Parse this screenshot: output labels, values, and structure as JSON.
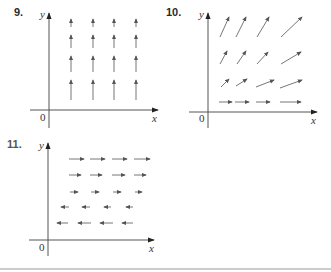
{
  "problems": [
    {
      "number": "9.",
      "axis_x_label": "x",
      "axis_y_label": "y",
      "origin_label": "0",
      "description": "Vector field: all vectors point straight up; length increases as y decreases",
      "vectors": [
        {
          "x1": 71,
          "y1": 27,
          "x2": 71,
          "y2": 19
        },
        {
          "x1": 93,
          "y1": 27,
          "x2": 93,
          "y2": 19
        },
        {
          "x1": 114,
          "y1": 27,
          "x2": 114,
          "y2": 19
        },
        {
          "x1": 136,
          "y1": 27,
          "x2": 136,
          "y2": 19
        },
        {
          "x1": 71,
          "y1": 48,
          "x2": 71,
          "y2": 35
        },
        {
          "x1": 93,
          "y1": 48,
          "x2": 93,
          "y2": 35
        },
        {
          "x1": 114,
          "y1": 48,
          "x2": 114,
          "y2": 35
        },
        {
          "x1": 136,
          "y1": 48,
          "x2": 136,
          "y2": 35
        },
        {
          "x1": 71,
          "y1": 72,
          "x2": 71,
          "y2": 56
        },
        {
          "x1": 93,
          "y1": 72,
          "x2": 93,
          "y2": 56
        },
        {
          "x1": 114,
          "y1": 72,
          "x2": 114,
          "y2": 56
        },
        {
          "x1": 136,
          "y1": 72,
          "x2": 136,
          "y2": 56
        },
        {
          "x1": 71,
          "y1": 100,
          "x2": 71,
          "y2": 80
        },
        {
          "x1": 93,
          "y1": 100,
          "x2": 93,
          "y2": 80
        },
        {
          "x1": 114,
          "y1": 100,
          "x2": 114,
          "y2": 80
        },
        {
          "x1": 136,
          "y1": 100,
          "x2": 136,
          "y2": 80
        }
      ]
    },
    {
      "number": "10.",
      "axis_x_label": "x",
      "axis_y_label": "y",
      "origin_label": "0",
      "description": "Vector field: bottom row horizontal to the right; rows above tilt upward, steeper and longer with height",
      "vectors": [
        {
          "x1": 220,
          "y1": 37,
          "x2": 229,
          "y2": 17
        },
        {
          "x1": 236,
          "y1": 37,
          "x2": 246,
          "y2": 17
        },
        {
          "x1": 257,
          "y1": 37,
          "x2": 269,
          "y2": 17
        },
        {
          "x1": 281,
          "y1": 37,
          "x2": 302,
          "y2": 17
        },
        {
          "x1": 220,
          "y1": 64,
          "x2": 227,
          "y2": 51
        },
        {
          "x1": 237,
          "y1": 64,
          "x2": 246,
          "y2": 51
        },
        {
          "x1": 257,
          "y1": 64,
          "x2": 268,
          "y2": 52
        },
        {
          "x1": 281,
          "y1": 64,
          "x2": 301,
          "y2": 52
        },
        {
          "x1": 221,
          "y1": 87,
          "x2": 229,
          "y2": 79
        },
        {
          "x1": 236,
          "y1": 86,
          "x2": 247,
          "y2": 79
        },
        {
          "x1": 256,
          "y1": 87,
          "x2": 274,
          "y2": 80
        },
        {
          "x1": 280,
          "y1": 88,
          "x2": 302,
          "y2": 80
        },
        {
          "x1": 219,
          "y1": 102,
          "x2": 232,
          "y2": 102
        },
        {
          "x1": 235,
          "y1": 102,
          "x2": 249,
          "y2": 102
        },
        {
          "x1": 256,
          "y1": 102,
          "x2": 270,
          "y2": 102
        },
        {
          "x1": 280,
          "y1": 102,
          "x2": 301,
          "y2": 102
        }
      ]
    },
    {
      "number": "11.",
      "axis_x_label": "x",
      "axis_y_label": "y",
      "origin_label": "0",
      "description": "Vector field: top three rows point right (shrinking downward), bottom two rows point left (growing downward)",
      "vectors": [
        {
          "x1": 69,
          "y1": 159,
          "x2": 84,
          "y2": 159
        },
        {
          "x1": 90,
          "y1": 159,
          "x2": 105,
          "y2": 159
        },
        {
          "x1": 112,
          "y1": 159,
          "x2": 127,
          "y2": 159
        },
        {
          "x1": 134,
          "y1": 159,
          "x2": 150,
          "y2": 159
        },
        {
          "x1": 69,
          "y1": 175,
          "x2": 81,
          "y2": 175
        },
        {
          "x1": 90,
          "y1": 175,
          "x2": 102,
          "y2": 175
        },
        {
          "x1": 112,
          "y1": 175,
          "x2": 125,
          "y2": 175
        },
        {
          "x1": 134,
          "y1": 175,
          "x2": 146,
          "y2": 175
        },
        {
          "x1": 70,
          "y1": 192,
          "x2": 78,
          "y2": 192
        },
        {
          "x1": 91,
          "y1": 192,
          "x2": 99,
          "y2": 192
        },
        {
          "x1": 113,
          "y1": 192,
          "x2": 121,
          "y2": 192
        },
        {
          "x1": 135,
          "y1": 192,
          "x2": 142,
          "y2": 192
        },
        {
          "x1": 69,
          "y1": 207,
          "x2": 61,
          "y2": 207
        },
        {
          "x1": 90,
          "y1": 207,
          "x2": 82,
          "y2": 207
        },
        {
          "x1": 111,
          "y1": 207,
          "x2": 104,
          "y2": 207
        },
        {
          "x1": 133,
          "y1": 207,
          "x2": 126,
          "y2": 207
        },
        {
          "x1": 68,
          "y1": 223,
          "x2": 57,
          "y2": 223
        },
        {
          "x1": 91,
          "y1": 223,
          "x2": 78,
          "y2": 223
        },
        {
          "x1": 113,
          "y1": 223,
          "x2": 100,
          "y2": 223
        },
        {
          "x1": 133,
          "y1": 223,
          "x2": 122,
          "y2": 223
        }
      ]
    }
  ]
}
